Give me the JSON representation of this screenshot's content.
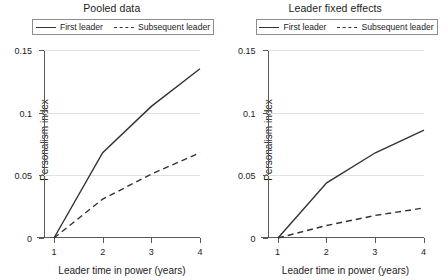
{
  "figure": {
    "y_axis_title": "Personalism index",
    "x_axis_title": "Leader time in power (years)",
    "y_ticks": [
      "0",
      "0.05",
      "0.1",
      "0.15"
    ],
    "x_ticks": [
      "1",
      "2",
      "3",
      "4"
    ],
    "legend": {
      "first": "First leader",
      "subsequent": "Subsequent leader"
    }
  },
  "chart_data": [
    {
      "type": "line",
      "title": "Pooled data",
      "xlabel": "Leader time in power (years)",
      "ylabel": "Personalism index",
      "x": [
        1,
        2,
        3,
        4
      ],
      "xlim": [
        1,
        4
      ],
      "ylim": [
        0,
        0.15
      ],
      "yticks": [
        0,
        0.05,
        0.1,
        0.15
      ],
      "grid": "horizontal",
      "legend_position": "top-center",
      "series": [
        {
          "name": "First leader",
          "style": "solid",
          "color": "#333333",
          "values": [
            0,
            0.068,
            0.105,
            0.135
          ]
        },
        {
          "name": "Subsequent leader",
          "style": "dashed",
          "color": "#333333",
          "values": [
            0,
            0.031,
            0.051,
            0.068
          ]
        }
      ]
    },
    {
      "type": "line",
      "title": "Leader fixed effects",
      "xlabel": "Leader time in power (years)",
      "ylabel": "Personalism index",
      "x": [
        1,
        2,
        3,
        4
      ],
      "xlim": [
        1,
        4
      ],
      "ylim": [
        0,
        0.15
      ],
      "yticks": [
        0,
        0.05,
        0.1,
        0.15
      ],
      "grid": "horizontal",
      "legend_position": "top-center",
      "series": [
        {
          "name": "First leader",
          "style": "solid",
          "color": "#333333",
          "values": [
            0,
            0.044,
            0.068,
            0.086
          ]
        },
        {
          "name": "Subsequent leader",
          "style": "dashed",
          "color": "#333333",
          "values": [
            0,
            0.01,
            0.018,
            0.024
          ]
        }
      ]
    }
  ]
}
